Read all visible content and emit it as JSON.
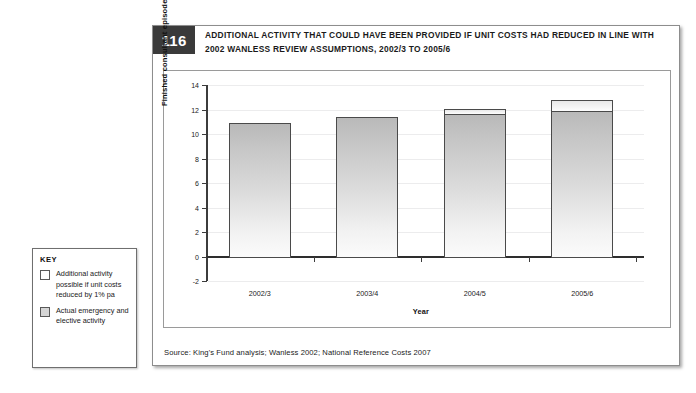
{
  "figure": {
    "number": "116",
    "title": "ADDITIONAL ACTIVITY THAT COULD HAVE BEEN PROVIDED IF UNIT COSTS HAD REDUCED IN LINE WITH 2002 WANLESS REVIEW ASSUMPTIONS, 2002/3 TO 2005/6",
    "source": "Source: King's Fund analysis; Wanless 2002; National Reference Costs 2007"
  },
  "key": {
    "title": "KEY",
    "items": [
      {
        "label": "Additional activity possible if unit costs reduced by 1% pa",
        "swatch": "sw-additional"
      },
      {
        "label": "Actual emergency and elective activity",
        "swatch": "sw-actual"
      }
    ]
  },
  "chart_data": {
    "type": "bar",
    "stacked": true,
    "title": "",
    "xlabel": "Year",
    "ylabel": "Finished consultant episodes (million)",
    "categories": [
      "2002/3",
      "2003/4",
      "2004/5",
      "2005/6"
    ],
    "ylim": [
      -2,
      14
    ],
    "yticks": [
      14,
      12,
      10,
      8,
      6,
      4,
      2,
      0,
      -2
    ],
    "ytick_labels": [
      "14",
      "12",
      "10",
      "8",
      "6",
      "4",
      "2",
      "0",
      "-2"
    ],
    "grid": true,
    "legend_position": "external-left",
    "series": [
      {
        "name": "Actual emergency and elective activity",
        "values": [
          11.0,
          11.5,
          11.7,
          12.0
        ]
      },
      {
        "name": "Additional activity possible if unit costs reduced by 1% pa",
        "values": [
          0.0,
          0.0,
          0.5,
          0.95
        ]
      }
    ],
    "totals": [
      11.0,
      11.5,
      12.2,
      12.95
    ]
  }
}
